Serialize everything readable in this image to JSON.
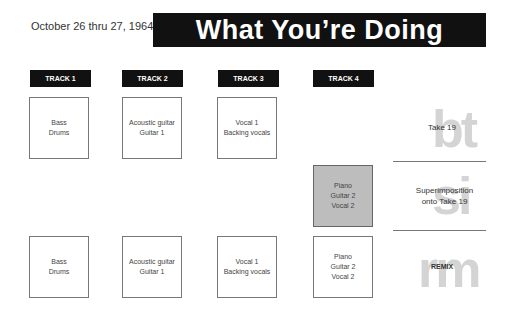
{
  "header": {
    "date": "October 26 thru 27, 1964",
    "title": "What You’re Doing"
  },
  "tracks": [
    {
      "label": "TRACK 1"
    },
    {
      "label": "TRACK 2"
    },
    {
      "label": "TRACK 3"
    },
    {
      "label": "TRACK 4"
    }
  ],
  "rows": {
    "take": {
      "boxes": [
        {
          "line1": "Bass",
          "line2": "Drums"
        },
        {
          "line1": "Acoustic guitar",
          "line2": "Guitar 1"
        },
        {
          "line1": "Vocal 1",
          "line2": "Backing vocals"
        }
      ],
      "ghost": "bt",
      "label": "Take 19"
    },
    "superimposition": {
      "box": {
        "line1": "Piano",
        "line2": "Guitar 2",
        "line3": "Vocal 2"
      },
      "ghost": "si",
      "label_line1": "Superimposition",
      "label_line2": "onto Take 19"
    },
    "remix": {
      "boxes": [
        {
          "line1": "Bass",
          "line2": "Drums"
        },
        {
          "line1": "Acoustic guitar",
          "line2": "Guitar 1"
        },
        {
          "line1": "Vocal 1",
          "line2": "Backing vocals"
        },
        {
          "line1": "Piano",
          "line2": "Guitar 2",
          "line3": "Vocal 2"
        }
      ],
      "ghost": "rm",
      "label": "REMIX"
    }
  },
  "colors": {
    "header_bg": "#111111",
    "superimposed_box": "#bdbdbd",
    "ghost_text": "#d4d4d4"
  }
}
